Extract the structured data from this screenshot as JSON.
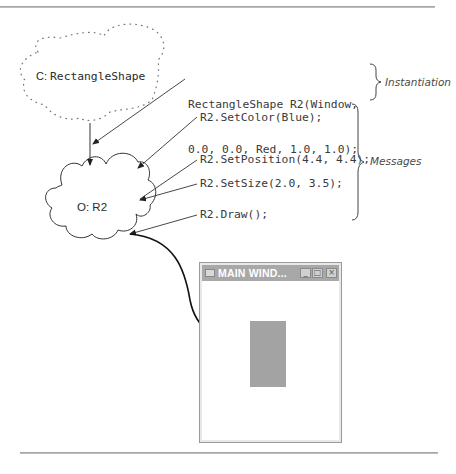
{
  "class_cloud": {
    "label_prefix": "C:",
    "label_name": "RectangleShape"
  },
  "object_cloud": {
    "label": "O: R2"
  },
  "instantiation": {
    "code_line1": "RectangleShape R2(Window,",
    "code_line2": "0.0, 0.0, Red, 1.0, 1.0);",
    "annotation": "Instantiation"
  },
  "messages": {
    "items": [
      "R2.SetColor(Blue);",
      "R2.SetPosition(4.4, 4.4);",
      "R2.SetSize(2.0, 3.5);",
      "R2.Draw();"
    ],
    "annotation": "Messages"
  },
  "window": {
    "title": "MAIN WIND...",
    "minimize_glyph": "_",
    "maximize_glyph": "□",
    "close_glyph": "×",
    "shape_color": "#a3a3a3"
  }
}
